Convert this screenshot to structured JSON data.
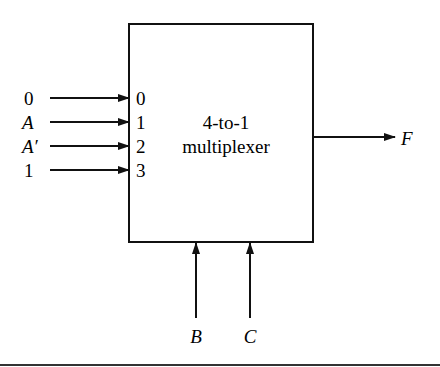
{
  "diagram": {
    "block_label_line1": "4-to-1",
    "block_label_line2": "multiplexer",
    "input_pins": [
      "0",
      "1",
      "2",
      "3"
    ],
    "input_signals": [
      "0",
      "A",
      "A′",
      "1"
    ],
    "select_signals": [
      "B",
      "C"
    ],
    "output_signal": "F",
    "colors": {
      "stroke": "#111111",
      "background": "#ffffff"
    }
  }
}
